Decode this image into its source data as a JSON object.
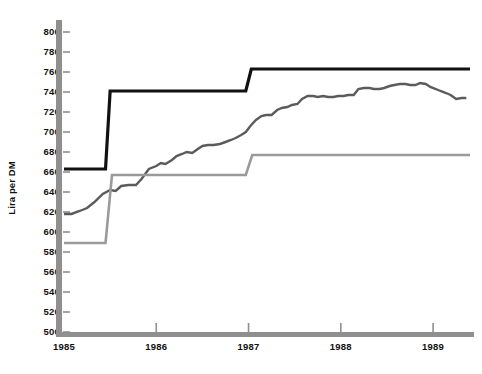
{
  "chart_data": {
    "type": "line",
    "title": "",
    "xlabel": "",
    "ylabel": "Lira per DM",
    "ylim": [
      500,
      800
    ],
    "ytick_step": 20,
    "yticks": [
      500,
      520,
      540,
      560,
      580,
      600,
      620,
      640,
      660,
      680,
      700,
      720,
      740,
      760,
      780,
      800
    ],
    "xticks": [
      "1985",
      "1986",
      "1987",
      "1988",
      "1989"
    ],
    "xlim": [
      "1985",
      "1989.4"
    ],
    "grid": false,
    "legend": "none",
    "colors": {
      "upper_band": "#111111",
      "market_rate": "#5b5b5b",
      "lower_band": "#9a9a9a",
      "axis": "#8f8f8f"
    },
    "series": [
      {
        "name": "upper_band",
        "style": "step",
        "color": "#111111",
        "width": 3.2,
        "points": [
          [
            1985.0,
            663
          ],
          [
            1985.45,
            663
          ],
          [
            1985.5,
            741
          ],
          [
            1986.97,
            741
          ],
          [
            1987.03,
            763
          ],
          [
            1989.4,
            763
          ]
        ]
      },
      {
        "name": "market_rate",
        "style": "line",
        "color": "#5b5b5b",
        "width": 2.4,
        "points": [
          [
            1985.0,
            618
          ],
          [
            1985.08,
            618
          ],
          [
            1985.17,
            621
          ],
          [
            1985.25,
            624
          ],
          [
            1985.33,
            630
          ],
          [
            1985.42,
            638
          ],
          [
            1985.5,
            642
          ],
          [
            1985.56,
            641
          ],
          [
            1985.62,
            646
          ],
          [
            1985.7,
            647
          ],
          [
            1985.78,
            647
          ],
          [
            1985.84,
            653
          ],
          [
            1985.92,
            663
          ],
          [
            1986.0,
            666
          ],
          [
            1986.05,
            669
          ],
          [
            1986.1,
            668
          ],
          [
            1986.17,
            672
          ],
          [
            1986.22,
            676
          ],
          [
            1986.28,
            678
          ],
          [
            1986.33,
            680
          ],
          [
            1986.39,
            679
          ],
          [
            1986.45,
            683
          ],
          [
            1986.5,
            686
          ],
          [
            1986.56,
            687
          ],
          [
            1986.62,
            687
          ],
          [
            1986.69,
            688
          ],
          [
            1986.75,
            690
          ],
          [
            1986.81,
            692
          ],
          [
            1986.86,
            694
          ],
          [
            1986.92,
            697
          ],
          [
            1986.97,
            700
          ],
          [
            1987.02,
            706
          ],
          [
            1987.08,
            712
          ],
          [
            1987.14,
            716
          ],
          [
            1987.19,
            717
          ],
          [
            1987.25,
            717
          ],
          [
            1987.31,
            722
          ],
          [
            1987.36,
            724
          ],
          [
            1987.42,
            725
          ],
          [
            1987.47,
            727
          ],
          [
            1987.53,
            728
          ],
          [
            1987.58,
            733
          ],
          [
            1987.64,
            736
          ],
          [
            1987.7,
            736
          ],
          [
            1987.75,
            735
          ],
          [
            1987.81,
            736
          ],
          [
            1987.86,
            735
          ],
          [
            1987.92,
            735
          ],
          [
            1987.97,
            736
          ],
          [
            1988.03,
            736
          ],
          [
            1988.08,
            737
          ],
          [
            1988.14,
            737
          ],
          [
            1988.19,
            743
          ],
          [
            1988.25,
            744
          ],
          [
            1988.31,
            744
          ],
          [
            1988.36,
            743
          ],
          [
            1988.42,
            743
          ],
          [
            1988.47,
            744
          ],
          [
            1988.53,
            746
          ],
          [
            1988.58,
            747
          ],
          [
            1988.64,
            748
          ],
          [
            1988.7,
            748
          ],
          [
            1988.75,
            747
          ],
          [
            1988.81,
            747
          ],
          [
            1988.86,
            749
          ],
          [
            1988.92,
            748
          ],
          [
            1988.97,
            745
          ],
          [
            1989.03,
            743
          ],
          [
            1989.08,
            741
          ],
          [
            1989.14,
            739
          ],
          [
            1989.19,
            737
          ],
          [
            1989.25,
            733
          ],
          [
            1989.31,
            734
          ],
          [
            1989.36,
            734
          ]
        ]
      },
      {
        "name": "lower_band",
        "style": "step",
        "color": "#9a9a9a",
        "width": 2.6,
        "points": [
          [
            1985.0,
            589
          ],
          [
            1985.45,
            589
          ],
          [
            1985.52,
            657
          ],
          [
            1986.97,
            657
          ],
          [
            1987.04,
            677
          ],
          [
            1989.4,
            677
          ]
        ]
      }
    ]
  }
}
